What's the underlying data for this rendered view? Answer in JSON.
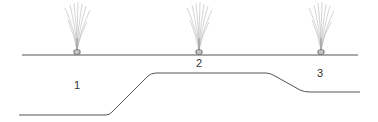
{
  "diagram": {
    "colors": {
      "line": "#555555",
      "spray": "#aaaaaa",
      "label": "#333333"
    },
    "labels": [
      "1",
      "2",
      "3"
    ],
    "sprinklers": [
      {
        "id": "1",
        "x": 77
      },
      {
        "id": "2",
        "x": 199
      },
      {
        "id": "3",
        "x": 321
      }
    ],
    "ground_line": {
      "y": 55,
      "x1": 22,
      "x2": 358
    },
    "terrain_profile": [
      [
        19,
        115
      ],
      [
        110,
        115
      ],
      [
        152,
        73
      ],
      [
        270,
        73
      ],
      [
        306,
        92
      ],
      [
        360,
        92
      ]
    ]
  }
}
